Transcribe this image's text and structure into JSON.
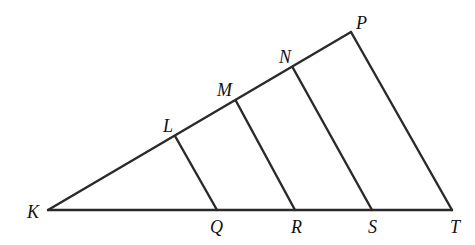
{
  "diagram": {
    "type": "triangle-with-parallel-segments",
    "stroke_color": "#2a2a2a",
    "points": {
      "K": {
        "label": "K",
        "x": 48,
        "y": 210
      },
      "L": {
        "label": "L",
        "x": 175,
        "y": 136
      },
      "M": {
        "label": "M",
        "x": 236,
        "y": 101
      },
      "N": {
        "label": "N",
        "x": 293,
        "y": 68
      },
      "P": {
        "label": "P",
        "x": 351,
        "y": 32
      },
      "Q": {
        "label": "Q",
        "x": 217,
        "y": 210
      },
      "R": {
        "label": "R",
        "x": 295,
        "y": 210
      },
      "S": {
        "label": "S",
        "x": 372,
        "y": 210
      },
      "T": {
        "label": "T",
        "x": 452,
        "y": 210
      }
    },
    "segments": [
      [
        "K",
        "P"
      ],
      [
        "K",
        "T"
      ],
      [
        "P",
        "T"
      ],
      [
        "L",
        "Q"
      ],
      [
        "M",
        "R"
      ],
      [
        "N",
        "S"
      ]
    ]
  }
}
